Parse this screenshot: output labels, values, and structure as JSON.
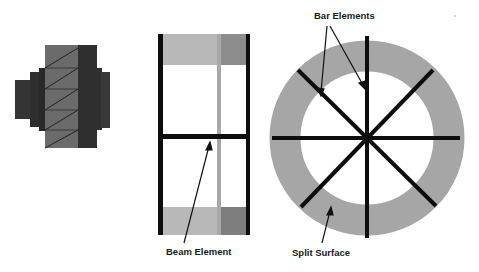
{
  "diagram": {
    "panels": [
      {
        "id": "solid-mesh",
        "description": "Stepped cylindrical part with triangular mesh on light face"
      },
      {
        "id": "frame",
        "description": "Side view with two vertical posts and horizontal beam element"
      },
      {
        "id": "ring",
        "description": "Annular split surface with eight radial bar elements"
      }
    ],
    "labels": {
      "beam": "Beam Element",
      "bar": "Bar Elements",
      "split": "Split Surface"
    },
    "colors": {
      "background": "#ffffff",
      "dark_gray": "#3a3a3a",
      "darker_gray": "#2b2b2b",
      "mid_gray": "#6e6e6e",
      "light_gray": "#b4b4b4",
      "block_dark": "#8a8a8a",
      "ring_gray": "#a6a6a6",
      "line_black": "#0d0d0d"
    }
  }
}
